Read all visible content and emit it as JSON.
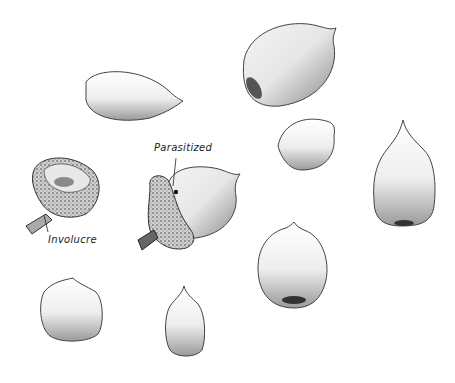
{
  "illustration": {
    "subject": "Pencil sketch of acorns",
    "labels": {
      "parasitized": "Parasitized",
      "involucre": "Involucre"
    },
    "colors": {
      "background": "#ffffff",
      "stroke": "#333333",
      "shade": "#9a9a9a"
    }
  }
}
